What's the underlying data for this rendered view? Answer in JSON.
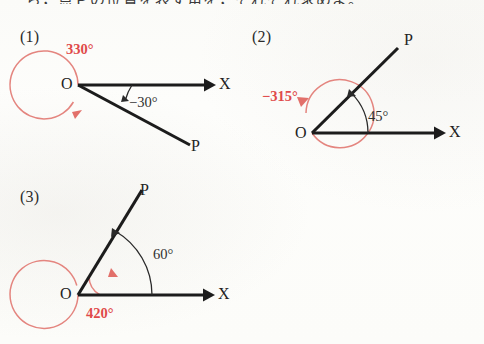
{
  "page": {
    "truncated_header_text": "ら，点Ｐの位置を表す角を，それぞれ求めよ。",
    "background_color": "#fdfdfb",
    "ink_color": "#1c1c1c",
    "accent_color": "#e04a4a",
    "accent_arc_color": "#e4857f"
  },
  "figures": [
    {
      "number": "(1)",
      "vertex_label": "O",
      "ray_label": "P",
      "axis_label": "X",
      "black_angle_label": "−30°",
      "red_angle_label": "330°",
      "angle_degrees": -30,
      "coterminal_degrees": 330
    },
    {
      "number": "(2)",
      "vertex_label": "O",
      "ray_label": "P",
      "axis_label": "X",
      "black_angle_label": "45°",
      "red_angle_label": "−315°",
      "angle_degrees": 45,
      "coterminal_degrees": -315
    },
    {
      "number": "(3)",
      "vertex_label": "O",
      "ray_label": "P",
      "axis_label": "X",
      "black_angle_label": "60°",
      "red_angle_label": "420°",
      "angle_degrees": 60,
      "coterminal_degrees": 420
    }
  ]
}
